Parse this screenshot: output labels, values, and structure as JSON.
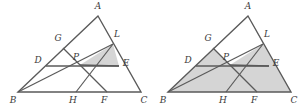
{
  "figure": {
    "count": 2,
    "background_color": "#ffffff",
    "stroke_color": "#5a5a5a",
    "shade_color": "#d5d5d5",
    "label_color": "#3b3b3b"
  },
  "vertex_labels": {
    "A": "A",
    "B": "B",
    "C": "C",
    "D": "D",
    "E": "E",
    "F": "F",
    "G": "G",
    "H": "H",
    "L": "L",
    "P": "P"
  },
  "left_figure": {
    "name": "left-triangle-diagram",
    "shaded_regions": [
      "P-L-E"
    ],
    "points": {
      "A": [
        98,
        16
      ],
      "B": [
        18,
        92
      ],
      "C": [
        141,
        92
      ],
      "D": [
        46,
        66
      ],
      "E": [
        119,
        66
      ],
      "F": [
        107,
        92
      ],
      "G": [
        63,
        48
      ],
      "H": [
        76,
        92
      ],
      "L": [
        113,
        44
      ],
      "P": [
        80,
        65
      ]
    },
    "label_positions": {
      "A": [
        98,
        9
      ],
      "B": [
        13,
        103
      ],
      "C": [
        144,
        103
      ],
      "D": [
        38,
        63
      ],
      "E": [
        126,
        66
      ],
      "F": [
        104,
        103
      ],
      "G": [
        58,
        41
      ],
      "H": [
        73,
        103
      ],
      "L": [
        117,
        37
      ],
      "P": [
        76,
        60
      ]
    },
    "segments": [
      [
        "A",
        "B"
      ],
      [
        "B",
        "C"
      ],
      [
        "C",
        "A"
      ],
      [
        "D",
        "E"
      ],
      [
        "G",
        "F"
      ],
      [
        "L",
        "H"
      ],
      [
        "B",
        "P"
      ],
      [
        "P",
        "L"
      ],
      [
        "P",
        "E"
      ]
    ]
  },
  "right_figure": {
    "name": "right-triangle-diagram",
    "shaded_regions": [
      "B-D-P-H",
      "D-G-P",
      "H-P-F",
      "P-F-C-E",
      "P-E-L",
      "entire-triangle-except-AGPL"
    ],
    "unshaded_regions": [
      "A-G-P-L"
    ],
    "points": {
      "A": [
        248,
        16
      ],
      "B": [
        168,
        92
      ],
      "C": [
        291,
        92
      ],
      "D": [
        196,
        66
      ],
      "E": [
        269,
        66
      ],
      "F": [
        257,
        92
      ],
      "G": [
        213,
        48
      ],
      "H": [
        226,
        92
      ],
      "L": [
        263,
        44
      ],
      "P": [
        230,
        65
      ]
    },
    "label_positions": {
      "A": [
        248,
        9
      ],
      "B": [
        163,
        103
      ],
      "C": [
        294,
        103
      ],
      "D": [
        188,
        63
      ],
      "E": [
        276,
        66
      ],
      "F": [
        254,
        103
      ],
      "G": [
        208,
        41
      ],
      "H": [
        223,
        103
      ],
      "L": [
        267,
        37
      ],
      "P": [
        226,
        60
      ]
    },
    "segments": [
      [
        "A",
        "B"
      ],
      [
        "B",
        "C"
      ],
      [
        "C",
        "A"
      ],
      [
        "D",
        "E"
      ],
      [
        "G",
        "F"
      ],
      [
        "L",
        "H"
      ],
      [
        "B",
        "P"
      ],
      [
        "P",
        "L"
      ],
      [
        "P",
        "E"
      ]
    ]
  }
}
